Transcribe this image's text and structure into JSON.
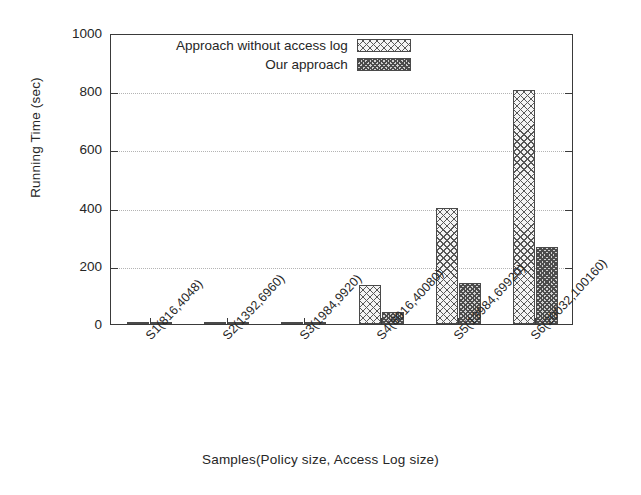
{
  "chart_data": {
    "type": "bar",
    "title": "",
    "xlabel": "Samples(Policy size, Access Log size)",
    "ylabel": "Running Time (sec)",
    "categories": [
      "S1(816,4048)",
      "S2(1392,6960)",
      "S3(1984,9920)",
      "S4(8016,40080)",
      "S5(13984,69920)",
      "S6(20032,100160)"
    ],
    "series": [
      {
        "name": "Approach without access log",
        "values": [
          2,
          3,
          7,
          135,
          398,
          805
        ],
        "pattern": "cross-hatch-light",
        "color": "#f4f4f4"
      },
      {
        "name": "Our approach",
        "values": [
          1,
          1,
          3,
          42,
          140,
          265
        ],
        "pattern": "cross-hatch-dense-dark",
        "color": "#d2d2d2"
      }
    ],
    "ylim": [
      0,
      1000
    ],
    "yticks": [
      0,
      200,
      400,
      600,
      800,
      1000
    ],
    "ytick_labels": [
      "0",
      "200",
      "400",
      "600",
      "800",
      "1000"
    ],
    "grid": true,
    "grid_axis": "y",
    "legend_position": "top-center-inside"
  },
  "legend": {
    "entries": [
      {
        "label": "Approach without access log",
        "swatch": "light"
      },
      {
        "label": "Our approach",
        "swatch": "dark"
      }
    ]
  }
}
